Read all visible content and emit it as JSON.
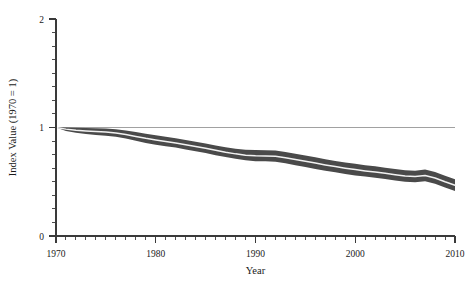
{
  "chart_data": {
    "type": "area",
    "title": "",
    "subtitle": "",
    "xlabel": "Year",
    "ylabel": "Index Value (1970 = 1)",
    "xlim": [
      1970,
      2010
    ],
    "ylim": [
      0,
      2
    ],
    "grid": false,
    "legend": null,
    "legend_position": "none",
    "x_major_ticks": [
      1970,
      1980,
      1990,
      2000,
      2010
    ],
    "x_major_tick_labels": [
      "1970",
      "1980",
      "1990",
      "2000",
      "2010"
    ],
    "x_minor_tick_interval": 1,
    "y_major_ticks": [
      0,
      1,
      2
    ],
    "y_major_tick_labels": [
      "0",
      "1",
      "2"
    ],
    "y_minor_tick_interval": 0.125,
    "reference_line": {
      "axis": "y",
      "value": 1,
      "label": "",
      "color": "#8a8a8a"
    },
    "band_color": "#4a4a4a",
    "center_line_color": "#f2f2f2",
    "x": [
      1970,
      1971,
      1972,
      1973,
      1974,
      1975,
      1976,
      1977,
      1978,
      1979,
      1980,
      1981,
      1982,
      1983,
      1984,
      1985,
      1986,
      1987,
      1988,
      1989,
      1990,
      1991,
      1992,
      1993,
      1994,
      1995,
      1996,
      1997,
      1998,
      1999,
      2000,
      2001,
      2002,
      2003,
      2004,
      2005,
      2006,
      2007,
      2008,
      2009,
      2010
    ],
    "series": [
      {
        "name": "Index (central estimate)",
        "values": [
          1.0,
          0.985,
          0.975,
          0.968,
          0.962,
          0.958,
          0.95,
          0.935,
          0.918,
          0.9,
          0.885,
          0.872,
          0.858,
          0.842,
          0.825,
          0.808,
          0.79,
          0.772,
          0.757,
          0.745,
          0.74,
          0.738,
          0.735,
          0.722,
          0.705,
          0.688,
          0.672,
          0.655,
          0.64,
          0.625,
          0.612,
          0.6,
          0.59,
          0.578,
          0.565,
          0.552,
          0.548,
          0.558,
          0.535,
          0.5,
          0.468
        ]
      },
      {
        "name": "Upper bound",
        "values": [
          1.0,
          1.0,
          0.998,
          0.995,
          0.992,
          0.99,
          0.985,
          0.972,
          0.958,
          0.942,
          0.928,
          0.915,
          0.9,
          0.885,
          0.868,
          0.852,
          0.835,
          0.818,
          0.805,
          0.795,
          0.792,
          0.79,
          0.788,
          0.775,
          0.758,
          0.742,
          0.725,
          0.708,
          0.692,
          0.678,
          0.665,
          0.652,
          0.642,
          0.63,
          0.618,
          0.605,
          0.602,
          0.612,
          0.59,
          0.555,
          0.522
        ]
      },
      {
        "name": "Lower bound",
        "values": [
          1.0,
          0.968,
          0.952,
          0.94,
          0.932,
          0.925,
          0.915,
          0.898,
          0.878,
          0.858,
          0.842,
          0.828,
          0.815,
          0.798,
          0.782,
          0.765,
          0.745,
          0.728,
          0.712,
          0.698,
          0.69,
          0.688,
          0.685,
          0.67,
          0.652,
          0.635,
          0.618,
          0.602,
          0.588,
          0.572,
          0.558,
          0.548,
          0.538,
          0.525,
          0.512,
          0.5,
          0.495,
          0.505,
          0.482,
          0.448,
          0.415
        ]
      }
    ]
  }
}
